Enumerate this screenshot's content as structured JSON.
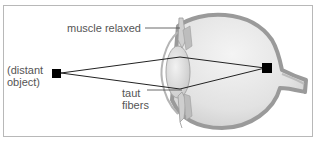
{
  "diagram": {
    "labels": {
      "muscle": "muscle relaxed",
      "distant_line1": "(distant",
      "distant_line2": "object)",
      "taut_line1": "taut",
      "taut_line2": "fibers"
    },
    "colors": {
      "frame": "#b8b8b8",
      "rays": "#222222",
      "object": "#000000",
      "eye_wall": "#9a9a9a",
      "eye_fill": "#e6e6e6",
      "label_text": "#555555"
    },
    "elements": {
      "distant_object": "black square (distant object)",
      "image_on_retina": "black square on retina",
      "lens": "flattened lens",
      "ciliary_muscle": "relaxed ciliary muscle",
      "zonule_fibers": "taut fibers",
      "optic_nerve": "optic nerve stub"
    }
  }
}
